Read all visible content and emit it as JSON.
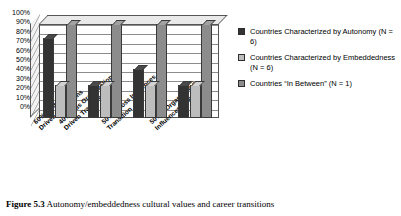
{
  "caption": {
    "label": "Figure 5.3",
    "text": "Autonomy/embeddedness cultural values and career transitions"
  },
  "legend": {
    "items": [
      {
        "label": "Countries Characterized by Autonomy (N = 6)",
        "color": "#333333"
      },
      {
        "label": "Countries Characterized by Embeddedness (N = 6)",
        "color": "#bdbdbd"
      },
      {
        "label": "Countries “In Between” (N = 1)",
        "color": "#8c8c8c"
      }
    ]
  },
  "chart_data": {
    "type": "bar",
    "title": "",
    "xlabel": "",
    "ylabel": "",
    "ylim": [
      0,
      100
    ],
    "grid": true,
    "legend_position": "right",
    "tick_labels": [
      "100%",
      "90%",
      "80%",
      "70%",
      "60%",
      "50%",
      "40%",
      "30%",
      "20%",
      "10%",
      "0%"
    ],
    "categories": [
      "60% + Internally Driven Transitions",
      "40% Plus Organizationally Driven Transitions",
      "50% + Boss Influences Transition",
      "50% + Organization Influences Transition"
    ],
    "category_lines": [
      [
        "60% + Internally",
        "Driven Transitions"
      ],
      [
        "40% Plus Organizationally",
        "Driven Transitions"
      ],
      [
        "50% + Boss Influences",
        "Transition"
      ],
      [
        "50% + Organization",
        "Influences Transition"
      ]
    ],
    "series": [
      {
        "name": "Countries Characterized by Autonomy (N = 6)",
        "color": "#333333",
        "values": [
          85,
          35,
          52,
          35
        ]
      },
      {
        "name": "Countries Characterized by Embeddedness (N = 6)",
        "color": "#bdbdbd",
        "values": [
          35,
          35,
          35,
          35
        ]
      },
      {
        "name": "Countries “In Between” (N = 1)",
        "color": "#8c8c8c",
        "values": [
          100,
          100,
          100,
          100
        ]
      }
    ]
  }
}
